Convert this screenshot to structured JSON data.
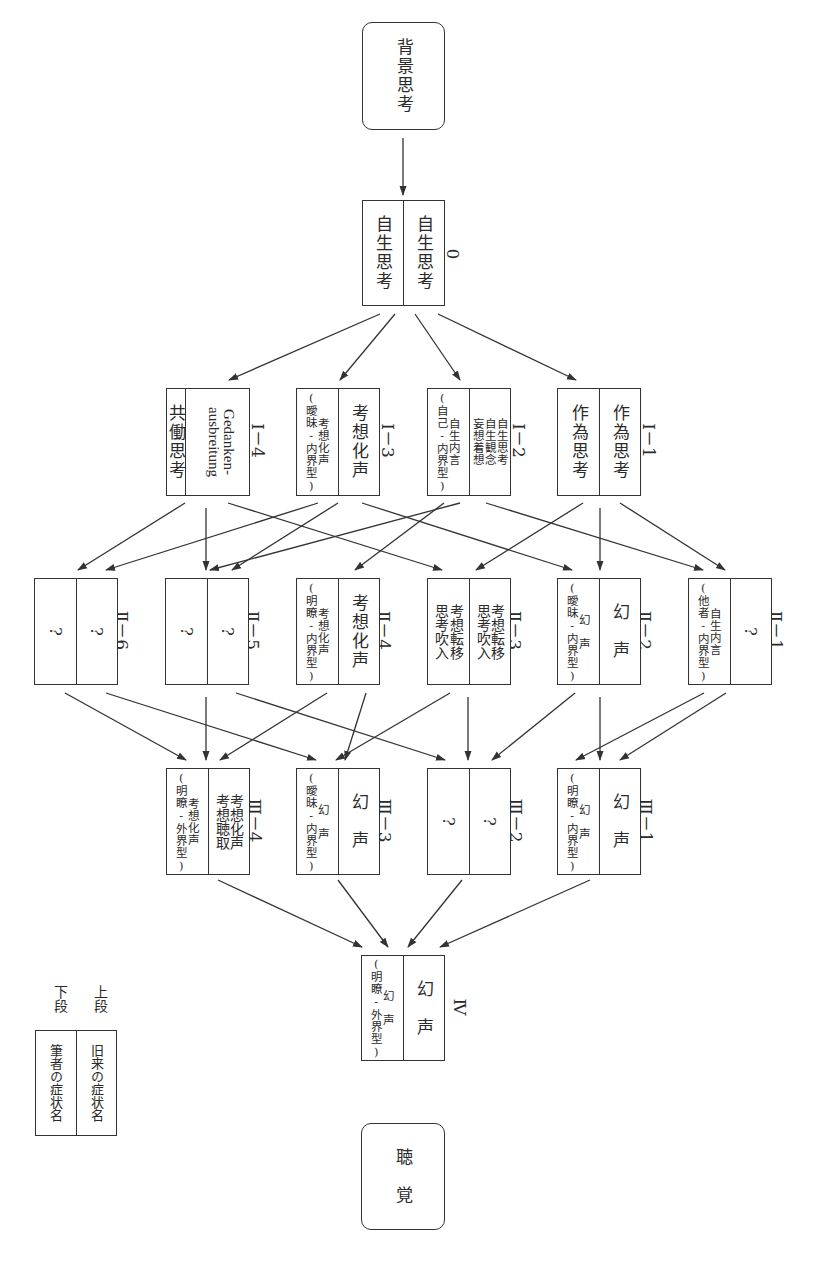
{
  "diagram": {
    "orientation": "rotated-90-clockwise",
    "top_node": {
      "label": "背景思考"
    },
    "bottom_node": {
      "label": "聴　覚"
    },
    "legend": {
      "upper_key": "上段",
      "lower_key": "下段",
      "upper_value": "旧来の症状名",
      "lower_value": "筆者の症状名"
    },
    "nodes": {
      "n0": {
        "id": "0",
        "upper": "自生思考",
        "lower": "自生思考"
      },
      "I1": {
        "id": "Ⅰ－1",
        "upper": "作為思考",
        "lower": "作為思考"
      },
      "I2": {
        "id": "Ⅰ－2",
        "upper": "自生思考\n自生観念\n妄想着想",
        "lower": "自生内言\n(自己-内界型)"
      },
      "I3": {
        "id": "Ⅰ－3",
        "upper": "考想化声",
        "lower": "考想化声\n(曖昧-内界型)"
      },
      "I4": {
        "id": "Ⅰ－4",
        "upper": "Gedanken-\nausbreitung",
        "lower": "共働思考"
      },
      "II1": {
        "id": "Ⅱ－1",
        "upper": "?",
        "lower": "自生内言\n(他者-内界型)"
      },
      "II2": {
        "id": "Ⅱ－2",
        "upper": "幻　声",
        "lower": "幻　声\n(曖昧-内界型)"
      },
      "II3": {
        "id": "Ⅱ－3",
        "upper": "考想転移\n思考吹入",
        "lower": "考想転移\n思考吹入"
      },
      "II4": {
        "id": "Ⅱ－4",
        "upper": "考想化声",
        "lower": "考想化声\n(明瞭-内界型)"
      },
      "II5": {
        "id": "Ⅱ－5",
        "upper": "?",
        "lower": "?"
      },
      "II6": {
        "id": "Ⅱ－6",
        "upper": "?",
        "lower": "?"
      },
      "III1": {
        "id": "Ⅲ－1",
        "upper": "幻　声",
        "lower": "幻　声\n(明瞭-内界型)"
      },
      "III2": {
        "id": "Ⅲ－2",
        "upper": "?",
        "lower": "?"
      },
      "III3": {
        "id": "Ⅲ－3",
        "upper": "幻　声",
        "lower": "幻　声\n(曖昧-内界型)"
      },
      "III4": {
        "id": "Ⅲ－4",
        "upper": "考想化声\n考想聴取",
        "lower": "考想化声\n(明瞭-外界型)"
      },
      "IV": {
        "id": "Ⅳ",
        "upper": "幻　声",
        "lower": "幻　声\n(明瞭-外界型)"
      }
    },
    "edges": [
      [
        "top",
        "n0"
      ],
      [
        "n0",
        "I1"
      ],
      [
        "n0",
        "I2"
      ],
      [
        "n0",
        "I3"
      ],
      [
        "n0",
        "I4"
      ],
      [
        "I1",
        "II1"
      ],
      [
        "I1",
        "II2"
      ],
      [
        "I1",
        "II3"
      ],
      [
        "I2",
        "II1"
      ],
      [
        "I2",
        "II4"
      ],
      [
        "I2",
        "II5"
      ],
      [
        "I3",
        "II2"
      ],
      [
        "I3",
        "II4"
      ],
      [
        "I3",
        "II6"
      ],
      [
        "I4",
        "II3"
      ],
      [
        "I4",
        "II5"
      ],
      [
        "I4",
        "II6"
      ],
      [
        "II1",
        "III1"
      ],
      [
        "II1",
        "III2"
      ],
      [
        "II2",
        "III1"
      ],
      [
        "II2",
        "III3"
      ],
      [
        "II3",
        "III2"
      ],
      [
        "II3",
        "III4"
      ],
      [
        "II4",
        "III3"
      ],
      [
        "II4",
        "III4"
      ],
      [
        "II5",
        "III2"
      ],
      [
        "II5",
        "III4"
      ],
      [
        "II6",
        "III3"
      ],
      [
        "II6",
        "III4"
      ],
      [
        "III1",
        "IV"
      ],
      [
        "III2",
        "IV"
      ],
      [
        "III3",
        "IV"
      ],
      [
        "III4",
        "IV"
      ]
    ]
  }
}
